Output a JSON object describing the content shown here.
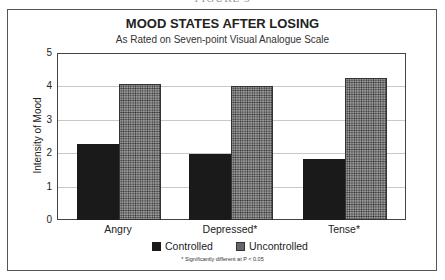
{
  "caption_cut": "FIGURE 3",
  "chart_data": {
    "type": "bar",
    "title": "MOOD STATES AFTER LOSING",
    "subtitle": "As Rated on Seven-point Visual Analogue Scale",
    "xlabel": "",
    "ylabel": "Intensity of Mood",
    "ylim": [
      0,
      5
    ],
    "yticks": [
      0,
      1,
      2,
      3,
      4,
      5
    ],
    "grid": true,
    "legend_position": "bottom",
    "categories": [
      "Angry",
      "Depressed*",
      "Tense*"
    ],
    "series": [
      {
        "name": "Controlled",
        "values": [
          2.28,
          1.97,
          1.83
        ],
        "color": "#1a1a1a"
      },
      {
        "name": "Uncontrolled",
        "values": [
          4.06,
          4.02,
          4.26
        ],
        "color": "#9a9a9a",
        "pattern": "dotted"
      }
    ],
    "footnote": "* Significantly different at P < 0.05"
  },
  "yticks_labels": [
    "0",
    "1",
    "2",
    "3",
    "4",
    "5"
  ]
}
